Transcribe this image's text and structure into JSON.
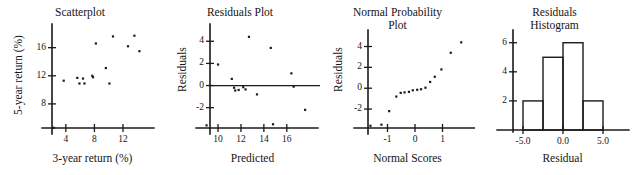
{
  "figure": {
    "width": 634,
    "height": 175,
    "background": "#ffffff",
    "ink_color": "#1a1a1a"
  },
  "panels": [
    {
      "key": "scatterplot",
      "title": "Scatterplot",
      "xlabel": "3-year return (%)",
      "ylabel": "5-year return (%)",
      "xticks": [
        "4",
        "8",
        "12"
      ],
      "yticks": [
        "8",
        "12",
        "16"
      ]
    },
    {
      "key": "residuals_plot",
      "title": "Residuals Plot",
      "xlabel": "Predicted",
      "ylabel": "Residuals",
      "xticks": [
        "10",
        "12",
        "14",
        "16"
      ],
      "yticks": [
        "-2",
        "0",
        "2",
        "4"
      ]
    },
    {
      "key": "normal_probability_plot",
      "title": "Normal Probability\nPlot",
      "xlabel": "Normal Scores",
      "ylabel": "Residuals",
      "xticks": [
        "-1",
        "0",
        "1"
      ],
      "yticks": [
        "-2",
        "0",
        "2",
        "4"
      ]
    },
    {
      "key": "residuals_histogram",
      "title": "Residuals\nHistogram",
      "xlabel": "Residual",
      "ylabel": "",
      "xticks": [
        "-5.0",
        "0.0",
        "5.0"
      ],
      "yticks": [
        "2",
        "4",
        "6"
      ]
    }
  ],
  "chart_data": [
    {
      "type": "scatter",
      "key": "scatterplot",
      "title": "Scatterplot",
      "xlabel": "3-year return (%)",
      "ylabel": "5-year return (%)",
      "xlim": [
        1.5,
        15.5
      ],
      "ylim": [
        4.0,
        18.8
      ],
      "xticks": [
        4,
        8,
        12
      ],
      "yticks": [
        8,
        12,
        16
      ],
      "grid": false,
      "legend": "none",
      "points": [
        {
          "x": 2.3,
          "y": 4.6
        },
        {
          "x": 3.7,
          "y": 11.3
        },
        {
          "x": 5.6,
          "y": 11.7
        },
        {
          "x": 5.9,
          "y": 10.9
        },
        {
          "x": 6.4,
          "y": 11.6
        },
        {
          "x": 6.6,
          "y": 10.9
        },
        {
          "x": 7.7,
          "y": 12.0
        },
        {
          "x": 7.8,
          "y": 11.8
        },
        {
          "x": 8.2,
          "y": 16.6
        },
        {
          "x": 9.6,
          "y": 13.1
        },
        {
          "x": 10.1,
          "y": 10.9
        },
        {
          "x": 10.6,
          "y": 17.6
        },
        {
          "x": 12.7,
          "y": 16.2
        },
        {
          "x": 13.6,
          "y": 17.7
        },
        {
          "x": 14.3,
          "y": 15.5
        }
      ]
    },
    {
      "type": "scatter",
      "key": "residuals_plot",
      "title": "Residuals Plot",
      "xlabel": "Predicted",
      "ylabel": "Residuals",
      "xlim": [
        8.6,
        18.2
      ],
      "ylim": [
        -4.2,
        5.2
      ],
      "xticks": [
        10,
        12,
        14,
        16
      ],
      "yticks": [
        -2,
        0,
        2,
        4
      ],
      "grid": false,
      "zero_line": true,
      "legend": "none",
      "points": [
        {
          "x": 9.0,
          "y": -3.6
        },
        {
          "x": 10.0,
          "y": 1.9
        },
        {
          "x": 11.2,
          "y": 0.6
        },
        {
          "x": 11.4,
          "y": -0.2
        },
        {
          "x": 11.5,
          "y": -0.45
        },
        {
          "x": 11.8,
          "y": -0.4
        },
        {
          "x": 12.2,
          "y": -0.15
        },
        {
          "x": 12.4,
          "y": -0.35
        },
        {
          "x": 12.7,
          "y": 4.4
        },
        {
          "x": 13.4,
          "y": -0.8
        },
        {
          "x": 14.6,
          "y": 3.4
        },
        {
          "x": 14.8,
          "y": -3.5
        },
        {
          "x": 16.4,
          "y": 1.1
        },
        {
          "x": 16.6,
          "y": -0.1
        },
        {
          "x": 17.6,
          "y": -2.2
        }
      ]
    },
    {
      "type": "scatter",
      "key": "normal_probability_plot",
      "title": "Normal Probability Plot",
      "xlabel": "Normal Scores",
      "ylabel": "Residuals",
      "xlim": [
        -2.0,
        2.0
      ],
      "ylim": [
        -4.2,
        5.2
      ],
      "xticks": [
        -1,
        0,
        1
      ],
      "yticks": [
        -2,
        0,
        2,
        4
      ],
      "grid": false,
      "legend": "none",
      "points": [
        {
          "x": -1.62,
          "y": -3.6
        },
        {
          "x": -1.22,
          "y": -3.5
        },
        {
          "x": -0.94,
          "y": -2.2
        },
        {
          "x": -0.68,
          "y": -0.8
        },
        {
          "x": -0.52,
          "y": -0.45
        },
        {
          "x": -0.38,
          "y": -0.4
        },
        {
          "x": -0.22,
          "y": -0.35
        },
        {
          "x": -0.08,
          "y": -0.2
        },
        {
          "x": 0.08,
          "y": -0.15
        },
        {
          "x": 0.22,
          "y": -0.1
        },
        {
          "x": 0.38,
          "y": 0.05
        },
        {
          "x": 0.55,
          "y": 0.6
        },
        {
          "x": 0.72,
          "y": 1.1
        },
        {
          "x": 0.96,
          "y": 1.8
        },
        {
          "x": 1.3,
          "y": 3.4
        },
        {
          "x": 1.68,
          "y": 4.4
        }
      ]
    },
    {
      "type": "bar",
      "key": "residuals_histogram",
      "title": "Residuals Histogram",
      "xlabel": "Residual",
      "ylabel": "",
      "categories": [
        "-5.0 to -2.5",
        "-2.5 to 0.0",
        "0.0 to 2.5",
        "2.5 to 5.0"
      ],
      "bin_edges": [
        -5.0,
        -2.5,
        0.0,
        2.5,
        5.0
      ],
      "values": [
        2,
        5,
        6,
        2
      ],
      "xlim": [
        -7.5,
        7.5
      ],
      "ylim": [
        0,
        6.6
      ],
      "xticks": [
        -5.0,
        0.0,
        5.0
      ],
      "yticks": [
        2,
        4,
        6
      ],
      "grid": false,
      "legend": "none"
    }
  ]
}
